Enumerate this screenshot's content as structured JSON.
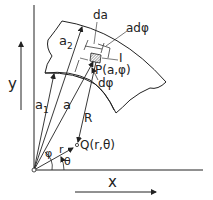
{
  "diagram": {
    "type": "geometry-figure",
    "labels": {
      "y_axis": "y",
      "x_axis": "x",
      "da": "da",
      "a_dphi": "adφ",
      "element_I": "I",
      "point_P": "P(a,φ)",
      "dphi": "dφ",
      "a2": "a",
      "a2_sub": "2",
      "a1": "a",
      "a1_sub": "1",
      "a": "a",
      "R": "R",
      "point_Q": "Q(r,θ)",
      "phi": "φ",
      "r": "r",
      "theta": "θ"
    },
    "colors": {
      "stroke": "#222222",
      "background": "#ffffff"
    }
  }
}
